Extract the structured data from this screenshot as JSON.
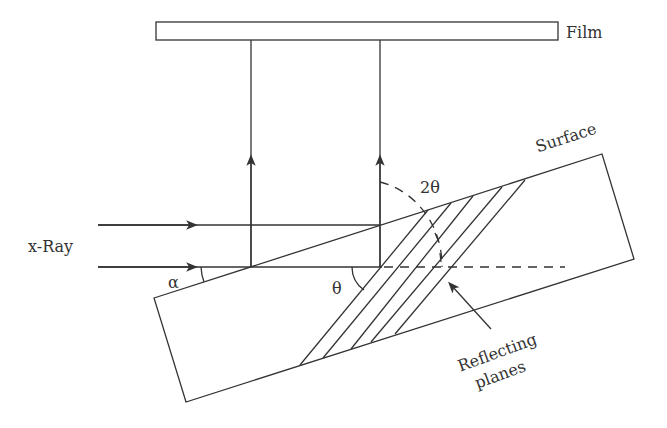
{
  "diagram": {
    "type": "x-ray diffraction geometry (reflecting planes inclined to crystal surface)",
    "labels": {
      "film": "Film",
      "xray": "x-Ray",
      "surface": "Surface",
      "alpha": "α",
      "theta": "θ",
      "two_theta": "2θ",
      "reflecting_line1": "Reflecting",
      "reflecting_line2": "planes"
    },
    "elements": {
      "film": {
        "x": 156,
        "y": 22,
        "width": 402,
        "height": 18
      },
      "incident_rays": [
        {
          "from": [
            98,
            225
          ],
          "to": [
            380,
            225
          ],
          "arrow_at": 190
        },
        {
          "from": [
            98,
            267
          ],
          "to": [
            251,
            267
          ],
          "arrow_at": 190
        }
      ],
      "diffracted_rays": [
        {
          "from": [
            251,
            267
          ],
          "to": [
            251,
            40
          ],
          "arrow_at": 160
        },
        {
          "from": [
            380,
            226
          ],
          "to": [
            380,
            40
          ],
          "arrow_at": 160
        }
      ],
      "crystal_corners": [
        [
          154,
          298
        ],
        [
          602,
          154
        ],
        [
          634,
          259
        ],
        [
          186,
          402
        ]
      ],
      "reference_line": {
        "solid_from": [
          251,
          267
        ],
        "solid_to": [
          380,
          267
        ],
        "dashed_to": [
          563,
          267
        ]
      },
      "reflecting_planes_count": 5
    },
    "colors": {
      "line": "#333333",
      "background": "#ffffff"
    }
  }
}
